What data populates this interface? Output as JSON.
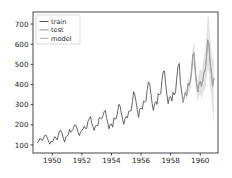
{
  "chart_data": {
    "type": "line",
    "title": "",
    "xlabel": "",
    "ylabel": "",
    "xlim": [
      1948.7,
      1961.2
    ],
    "ylim": [
      60,
      760
    ],
    "grid": false,
    "legend_position": "upper left",
    "xticks": [
      1950,
      1952,
      1954,
      1956,
      1958,
      1960
    ],
    "xtick_labels": [
      "1950",
      "1952",
      "1954",
      "1956",
      "1958",
      "1960"
    ],
    "yticks": [
      100,
      200,
      300,
      400,
      500,
      600,
      700
    ],
    "ytick_labels": [
      "100",
      "200",
      "300",
      "400",
      "500",
      "600",
      "700"
    ],
    "colors": {
      "train": "#4c4c4c",
      "test": "#8c8c8c",
      "model": "#a0a0a0",
      "band": "#b0b0b0",
      "axis": "#1a1a1a",
      "background": "#ffffff"
    },
    "series": [
      {
        "name": "train",
        "label": "train",
        "color": "#4c4c4c",
        "x": [
          1949.0,
          1949.0833,
          1949.1667,
          1949.25,
          1949.3333,
          1949.4167,
          1949.5,
          1949.5833,
          1949.6667,
          1949.75,
          1949.8333,
          1949.9167,
          1950.0,
          1950.0833,
          1950.1667,
          1950.25,
          1950.3333,
          1950.4167,
          1950.5,
          1950.5833,
          1950.6667,
          1950.75,
          1950.8333,
          1950.9167,
          1951.0,
          1951.0833,
          1951.1667,
          1951.25,
          1951.3333,
          1951.4167,
          1951.5,
          1951.5833,
          1951.6667,
          1951.75,
          1951.8333,
          1951.9167,
          1952.0,
          1952.0833,
          1952.1667,
          1952.25,
          1952.3333,
          1952.4167,
          1952.5,
          1952.5833,
          1952.6667,
          1952.75,
          1952.8333,
          1952.9167,
          1953.0,
          1953.0833,
          1953.1667,
          1953.25,
          1953.3333,
          1953.4167,
          1953.5,
          1953.5833,
          1953.6667,
          1953.75,
          1953.8333,
          1953.9167,
          1954.0,
          1954.0833,
          1954.1667,
          1954.25,
          1954.3333,
          1954.4167,
          1954.5,
          1954.5833,
          1954.6667,
          1954.75,
          1954.8333,
          1954.9167,
          1955.0,
          1955.0833,
          1955.1667,
          1955.25,
          1955.3333,
          1955.4167,
          1955.5,
          1955.5833,
          1955.6667,
          1955.75,
          1955.8333,
          1955.9167,
          1956.0,
          1956.0833,
          1956.1667,
          1956.25,
          1956.3333,
          1956.4167,
          1956.5,
          1956.5833,
          1956.6667,
          1956.75,
          1956.8333,
          1956.9167,
          1957.0,
          1957.0833,
          1957.1667,
          1957.25,
          1957.3333,
          1957.4167,
          1957.5,
          1957.5833,
          1957.6667,
          1957.75,
          1957.8333,
          1957.9167,
          1958.0,
          1958.0833,
          1958.1667,
          1958.25,
          1958.3333,
          1958.4167,
          1958.5,
          1958.5833,
          1958.6667,
          1958.75
        ],
        "values": [
          112,
          118,
          132,
          129,
          121,
          135,
          148,
          148,
          136,
          119,
          104,
          118,
          115,
          126,
          141,
          135,
          125,
          149,
          170,
          170,
          158,
          133,
          114,
          140,
          145,
          150,
          178,
          163,
          172,
          178,
          199,
          199,
          184,
          162,
          146,
          166,
          171,
          180,
          193,
          181,
          183,
          218,
          230,
          242,
          209,
          191,
          172,
          194,
          196,
          196,
          236,
          235,
          229,
          243,
          264,
          272,
          237,
          211,
          180,
          201,
          204,
          188,
          235,
          227,
          234,
          264,
          302,
          293,
          259,
          229,
          203,
          229,
          242,
          233,
          267,
          269,
          270,
          315,
          364,
          347,
          312,
          274,
          237,
          278,
          284,
          277,
          317,
          313,
          318,
          374,
          413,
          405,
          355,
          306,
          271,
          306,
          315,
          301,
          356,
          348,
          355,
          422,
          465,
          467,
          404,
          347,
          305,
          336,
          340,
          318,
          362,
          348,
          363,
          435,
          491,
          505,
          404,
          359
        ]
      },
      {
        "name": "test",
        "label": "test",
        "color": "#8c8c8c",
        "x": [
          1958.75,
          1958.8333,
          1958.9167,
          1959.0,
          1959.0833,
          1959.1667,
          1959.25,
          1959.3333,
          1959.4167,
          1959.5,
          1959.5833,
          1959.6667,
          1959.75,
          1959.8333,
          1959.9167,
          1960.0,
          1960.0833,
          1960.1667,
          1960.25,
          1960.3333,
          1960.4167,
          1960.5,
          1960.5833,
          1960.6667,
          1960.75,
          1960.8333,
          1960.9167
        ],
        "values": [
          359,
          310,
          337,
          360,
          342,
          406,
          396,
          420,
          472,
          548,
          559,
          463,
          407,
          362,
          405,
          417,
          391,
          419,
          461,
          472,
          535,
          622,
          606,
          508,
          461,
          390,
          432
        ]
      },
      {
        "name": "model",
        "label": "model",
        "color": "#a0a0a0",
        "x": [
          1958.75,
          1958.8333,
          1958.9167,
          1959.0,
          1959.0833,
          1959.1667,
          1959.25,
          1959.3333,
          1959.4167,
          1959.5,
          1959.5833,
          1959.6667,
          1959.75,
          1959.8333,
          1959.9167,
          1960.0,
          1960.0833,
          1960.1667,
          1960.25,
          1960.3333,
          1960.4167,
          1960.5,
          1960.5833,
          1960.6667,
          1960.75,
          1960.8333,
          1960.9167
        ],
        "values": [
          358,
          314,
          340,
          362,
          347,
          402,
          392,
          414,
          466,
          540,
          552,
          460,
          406,
          364,
          403,
          414,
          392,
          420,
          456,
          468,
          528,
          610,
          598,
          505,
          458,
          392,
          428
        ],
        "band_lower": [
          352,
          304,
          326,
          344,
          324,
          374,
          360,
          378,
          424,
          490,
          498,
          410,
          354,
          312,
          344,
          350,
          324,
          344,
          370,
          374,
          418,
          478,
          462,
          382,
          338,
          268,
          206
        ],
        "band_upper": [
          365,
          324,
          355,
          381,
          372,
          432,
          426,
          452,
          510,
          592,
          608,
          512,
          460,
          418,
          464,
          480,
          462,
          498,
          544,
          564,
          640,
          744,
          736,
          630,
          580,
          516,
          560
        ]
      }
    ]
  },
  "legend": {
    "entries": [
      {
        "label": "train"
      },
      {
        "label": "test"
      },
      {
        "label": "model"
      }
    ]
  }
}
